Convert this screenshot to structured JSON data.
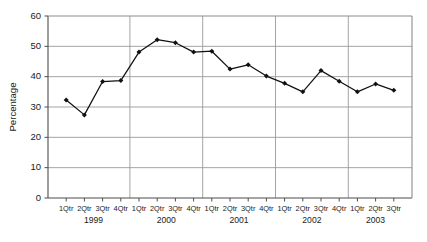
{
  "chart_data": {
    "type": "line",
    "title": "",
    "xlabel": "",
    "ylabel": "Percentage",
    "ylim": [
      0,
      60
    ],
    "ytick_values": [
      0,
      10,
      20,
      30,
      40,
      50,
      60
    ],
    "ytick_labels": [
      "0",
      "10",
      "20",
      "30",
      "40",
      "50",
      "60"
    ],
    "grid": true,
    "grid_axis": "both",
    "legend": false,
    "marker": "diamond",
    "line_color": "#111111",
    "grid_color": "#9a9a9a",
    "categories": [
      "1Qtr 1999",
      "2Qtr 1999",
      "3Qtr 1999",
      "4Qtr 1999",
      "1Qtr 2000",
      "2Qtr 2000",
      "3Qtr 2000",
      "4Qtr 2000",
      "1Qtr 2001",
      "2Qtr 2001",
      "3Qtr 2001",
      "4Qtr 2001",
      "1Qtr 2002",
      "2Qtr 2002",
      "3Qtr 2002",
      "4Qtr 2002",
      "1Qtr 2003",
      "2Qtr 2003",
      "3Qtr 2003"
    ],
    "xtick_labels": [
      "1Qtr",
      "2Qtr",
      "3Qtr",
      "4Qtr",
      "1Qtr",
      "2Qtr",
      "3Qtr",
      "4Qtr",
      "1Qtr",
      "2Qtr",
      "3Qtr",
      "4Qtr",
      "1Qtr",
      "2Qtr",
      "3Qtr",
      "4Qtr",
      "1Qtr",
      "2Qtr",
      "3Qtr"
    ],
    "year_groups": [
      {
        "label": "1999",
        "start_index": 0,
        "end_index": 3
      },
      {
        "label": "2000",
        "start_index": 4,
        "end_index": 7
      },
      {
        "label": "2001",
        "start_index": 8,
        "end_index": 11
      },
      {
        "label": "2002",
        "start_index": 12,
        "end_index": 15
      },
      {
        "label": "2003",
        "start_index": 16,
        "end_index": 18
      }
    ],
    "values": [
      32.3,
      27.4,
      38.4,
      38.7,
      48.1,
      52.2,
      51.2,
      48.1,
      48.4,
      42.5,
      43.9,
      40.2,
      37.8,
      35.0,
      42.0,
      38.5,
      35.0,
      37.6,
      35.5
    ]
  },
  "axis": {
    "ylabel": "Percentage"
  },
  "caption": {
    "text": ""
  }
}
